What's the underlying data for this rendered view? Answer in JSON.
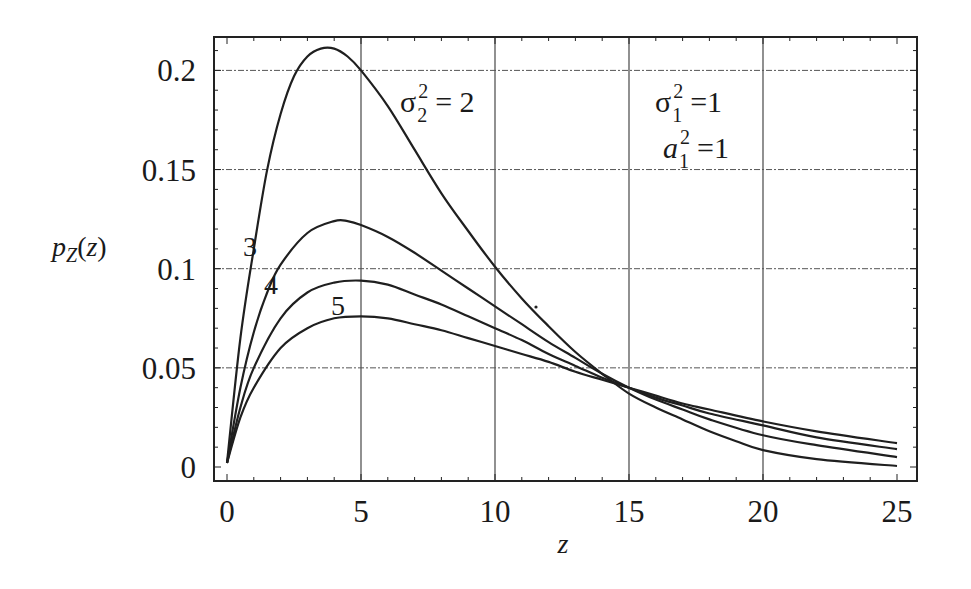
{
  "chart_data": {
    "type": "line",
    "title": "",
    "xlabel": "z",
    "ylabel": "p_Z(z)",
    "xlim": [
      0,
      25
    ],
    "ylim": [
      0,
      0.215
    ],
    "grid": true,
    "x_ticks": [
      0,
      5,
      10,
      15,
      20,
      25
    ],
    "x_tick_labels": [
      "0",
      "5",
      "10",
      "15",
      "20",
      "25"
    ],
    "y_ticks": [
      0,
      0.05,
      0.1,
      0.15,
      0.2
    ],
    "y_tick_labels": [
      "0",
      "0.05",
      "0.1",
      "0.15",
      "0.2"
    ],
    "annotations": [
      {
        "text": "σ₂² = 2",
        "base": "σ",
        "sup": "2",
        "sub": "2",
        "rest": "= 2",
        "applies_to": "curve sigma2^2=2"
      },
      {
        "text": "σ₁² = 1",
        "base": "σ",
        "sup": "2",
        "sub": "1",
        "rest": "=1"
      },
      {
        "text": "a₁² = 1",
        "base": "a",
        "sup": "2",
        "sub": "1",
        "rest": "=1"
      }
    ],
    "legend": null,
    "series": [
      {
        "name": "σ₂² = 2",
        "label": "σ₂² = 2",
        "x": [
          0,
          0.5,
          1,
          1.5,
          2,
          2.5,
          3,
          3.5,
          4,
          4.5,
          5,
          6,
          7,
          8,
          9,
          10,
          11,
          12,
          13,
          14,
          15,
          16,
          17,
          18,
          19,
          20,
          22,
          25
        ],
        "y": [
          0.002,
          0.065,
          0.11,
          0.15,
          0.178,
          0.197,
          0.207,
          0.211,
          0.211,
          0.207,
          0.2,
          0.182,
          0.16,
          0.138,
          0.119,
          0.101,
          0.085,
          0.071,
          0.058,
          0.047,
          0.037,
          0.03,
          0.024,
          0.018,
          0.013,
          0.0085,
          0.004,
          0.0005
        ]
      },
      {
        "name": "σ₂² = 3",
        "label": "3",
        "x": [
          0,
          0.5,
          1,
          1.5,
          2,
          3,
          4,
          4.5,
          5,
          6,
          7,
          8,
          9,
          10,
          11,
          12,
          13,
          14,
          15,
          16,
          17,
          18,
          20,
          22,
          25
        ],
        "y": [
          0.002,
          0.04,
          0.068,
          0.088,
          0.102,
          0.118,
          0.124,
          0.124,
          0.122,
          0.116,
          0.108,
          0.099,
          0.09,
          0.081,
          0.072,
          0.063,
          0.055,
          0.047,
          0.04,
          0.034,
          0.029,
          0.024,
          0.016,
          0.011,
          0.005
        ]
      },
      {
        "name": "σ₂² = 4",
        "label": "4",
        "x": [
          0,
          0.5,
          1,
          2,
          3,
          4,
          5,
          6,
          7,
          8,
          9,
          10,
          11,
          12,
          13,
          14,
          15,
          16,
          17,
          18,
          20,
          22,
          25
        ],
        "y": [
          0.002,
          0.03,
          0.05,
          0.075,
          0.088,
          0.093,
          0.094,
          0.092,
          0.087,
          0.082,
          0.076,
          0.07,
          0.064,
          0.057,
          0.051,
          0.045,
          0.04,
          0.035,
          0.031,
          0.027,
          0.021,
          0.015,
          0.009
        ]
      },
      {
        "name": "σ₂² = 5",
        "label": "5",
        "x": [
          0,
          0.5,
          1,
          2,
          3,
          4,
          5,
          6,
          7,
          8,
          9,
          10,
          11,
          12,
          13,
          14,
          15,
          16,
          17,
          18,
          20,
          22,
          25
        ],
        "y": [
          0.002,
          0.025,
          0.04,
          0.06,
          0.07,
          0.075,
          0.076,
          0.075,
          0.072,
          0.069,
          0.065,
          0.061,
          0.057,
          0.053,
          0.048,
          0.044,
          0.04,
          0.036,
          0.032,
          0.029,
          0.023,
          0.018,
          0.012
        ]
      }
    ]
  },
  "colors": {
    "line": "#1f1f1f",
    "grid": "#555555",
    "frame": "#222222",
    "background": "#ffffff"
  }
}
